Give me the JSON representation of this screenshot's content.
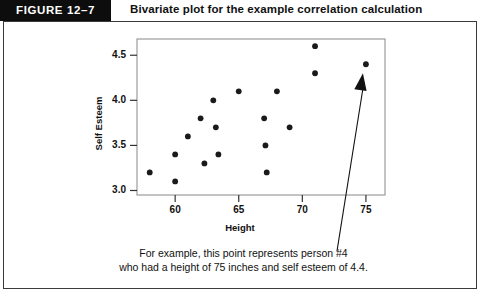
{
  "header": {
    "figure_number": "FIGURE  12–7",
    "figure_number_bg": "#0d0d0d",
    "title": "Bivariate plot for the example correlation calculation"
  },
  "caption": {
    "line1": "For example, this point represents person #4",
    "line2": "who had a height of 75 inches and self esteem of 4.4."
  },
  "annotation": {
    "arrow_name": "callout-arrow",
    "target_point": {
      "x": 75,
      "y": 4.4
    }
  },
  "chart_data": {
    "type": "scatter",
    "title": "Bivariate plot for the example correlation calculation",
    "xlabel": "Height",
    "ylabel": "Self Esteem",
    "xlim": [
      57,
      76.5
    ],
    "ylim": [
      2.95,
      4.68
    ],
    "grid": false,
    "legend": "none",
    "marker_color": "#1a1a1a",
    "xticks": [
      60,
      65,
      70,
      75
    ],
    "xtick_labels": [
      "60",
      "65",
      "70",
      "75"
    ],
    "yticks": [
      3.0,
      3.5,
      4.0,
      4.5
    ],
    "ytick_labels": [
      "3.0",
      "3.5",
      "4.0",
      "4.5"
    ],
    "points": [
      {
        "x": 58.0,
        "y": 3.2
      },
      {
        "x": 60.0,
        "y": 3.4
      },
      {
        "x": 60.0,
        "y": 3.1
      },
      {
        "x": 61.0,
        "y": 3.6
      },
      {
        "x": 62.0,
        "y": 3.8
      },
      {
        "x": 62.3,
        "y": 3.3
      },
      {
        "x": 63.0,
        "y": 4.0
      },
      {
        "x": 63.2,
        "y": 3.7
      },
      {
        "x": 63.4,
        "y": 3.4
      },
      {
        "x": 65.0,
        "y": 4.1
      },
      {
        "x": 67.0,
        "y": 3.8
      },
      {
        "x": 67.1,
        "y": 3.5
      },
      {
        "x": 67.2,
        "y": 3.2
      },
      {
        "x": 68.0,
        "y": 4.1
      },
      {
        "x": 69.0,
        "y": 3.7
      },
      {
        "x": 71.0,
        "y": 4.6
      },
      {
        "x": 71.0,
        "y": 4.3
      },
      {
        "x": 75.0,
        "y": 4.4
      }
    ]
  },
  "plot_box": {
    "left": 137,
    "right": 385,
    "top": 39,
    "bottom": 195,
    "border_color": "#888888"
  }
}
